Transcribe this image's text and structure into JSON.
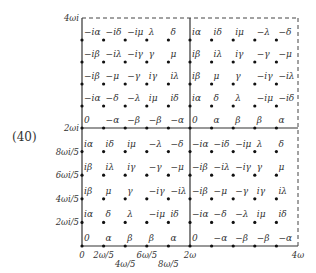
{
  "equation_label": "(40)",
  "geometry": {
    "x0": 82,
    "y0": 246,
    "dx": 21.6,
    "dy": 23.6,
    "x_mid": 190,
    "x_end": 298,
    "y_mid": 128,
    "y_top": 18
  },
  "axes": {
    "x_ticks": [
      {
        "label": "0",
        "col": 0,
        "row_offset": 0
      },
      {
        "label": "2ω/5",
        "col": 1,
        "row_offset": 0
      },
      {
        "label": "4ω/5",
        "col": 2,
        "row_offset": 1
      },
      {
        "label": "6ω/5",
        "col": 3,
        "row_offset": 0
      },
      {
        "label": "8ω/5",
        "col": 4,
        "row_offset": 1
      },
      {
        "label": "2ω",
        "col": 5,
        "row_offset": 0
      },
      {
        "label": "4ω",
        "col": 10,
        "row_offset": 0
      }
    ],
    "y_ticks": [
      {
        "label": "2ωi/5",
        "row": 1
      },
      {
        "label": "4ωi/5",
        "row": 2
      },
      {
        "label": "6ωi/5",
        "row": 3
      },
      {
        "label": "8ωi/5",
        "row": 4
      },
      {
        "label": "2ωi",
        "row": 5
      },
      {
        "label": "4ωi",
        "row": 10
      }
    ]
  },
  "quadrants": {
    "bottom_left": [
      [
        "0",
        "α",
        "β",
        "β",
        "α"
      ],
      [
        "iα",
        "δ",
        "λ",
        "−iμ",
        "iδ"
      ],
      [
        "iβ",
        "μ",
        "γ",
        "−iγ",
        "−iλ"
      ],
      [
        "iβ",
        "iλ",
        "iγ",
        "−γ",
        "−μ"
      ],
      [
        "iα",
        "iδ",
        "iμ",
        "−λ",
        "−δ"
      ]
    ],
    "bottom_right": [
      [
        "0",
        "−α",
        "−β",
        "−β",
        "−α"
      ],
      [
        "−iα",
        "−δ",
        "−λ",
        "iμ",
        "iδ"
      ],
      [
        "−iβ",
        "−μ",
        "−γ",
        "iγ",
        "iλ"
      ],
      [
        "−iβ",
        "−iλ",
        "−iγ",
        "γ",
        "μ"
      ],
      [
        "−iα",
        "−iδ",
        "−iμ",
        "λ",
        "δ"
      ]
    ],
    "top_left": [
      [
        "0",
        "−α",
        "−β",
        "−β",
        "−α"
      ],
      [
        "−iα",
        "−δ",
        "−λ",
        "iμ",
        "iδ"
      ],
      [
        "−iβ",
        "−μ",
        "−γ",
        "iγ",
        "iλ"
      ],
      [
        "−iβ",
        "−iλ",
        "−iγ",
        "γ",
        "μ"
      ],
      [
        "−iα",
        "−iδ",
        "−iμ",
        "λ",
        "δ"
      ]
    ],
    "top_right": [
      [
        "0",
        "α",
        "β",
        "β",
        "α"
      ],
      [
        "iα",
        "δ",
        "λ",
        "−iμ",
        "−iδ"
      ],
      [
        "iβ",
        "μ",
        "γ",
        "−iγ",
        "−iλ"
      ],
      [
        "iβ",
        "iλ",
        "iγ",
        "−γ",
        "−μ"
      ],
      [
        "iα",
        "iδ",
        "iμ",
        "−λ",
        "−δ"
      ]
    ]
  }
}
